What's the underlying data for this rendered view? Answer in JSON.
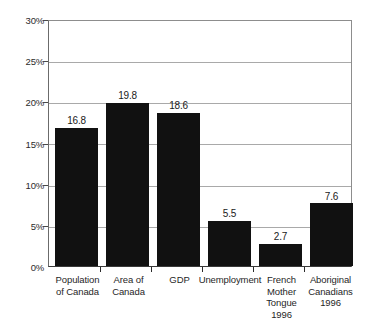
{
  "chart_data": {
    "type": "bar",
    "title": "",
    "subtitle": "",
    "xlabel": "",
    "ylabel": "",
    "ylim": [
      0,
      30
    ],
    "ytick_values": [
      0,
      5,
      10,
      15,
      20,
      25,
      30
    ],
    "ytick_labels": [
      "0%",
      "5%",
      "10%",
      "15%",
      "20%",
      "25%",
      "30%"
    ],
    "grid": true,
    "legend": false,
    "legend_position": "none",
    "bar_color": "#111111",
    "categories": [
      "Population of Canada",
      "Area of Canada",
      "GDP",
      "Unemployment",
      "French Mother Tongue 1996",
      "Aboriginal Canadians 1996"
    ],
    "category_lines": [
      [
        "Population",
        "of Canada"
      ],
      [
        "Area of",
        "Canada"
      ],
      [
        "GDP"
      ],
      [
        "Unemployment"
      ],
      [
        "French",
        "Mother",
        "Tongue",
        "1996"
      ],
      [
        "Aboriginal",
        "Canadians",
        "1996"
      ]
    ],
    "values": [
      16.8,
      19.8,
      18.6,
      5.5,
      2.7,
      7.6
    ],
    "value_labels": [
      "16.8",
      "19.8",
      "18.6",
      "5.5",
      "2.7",
      "7.6"
    ]
  }
}
